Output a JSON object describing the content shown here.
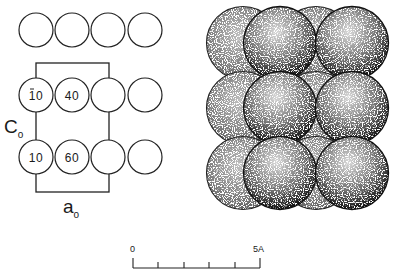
{
  "left_panel": {
    "rows": [
      {
        "name": "top-row",
        "cy": 30,
        "circles": [
          {
            "cx": 36,
            "label": ""
          },
          {
            "cx": 72,
            "label": ""
          },
          {
            "cx": 108,
            "label": ""
          },
          {
            "cx": 145,
            "label": ""
          }
        ]
      },
      {
        "name": "middle-row",
        "cy": 95,
        "circles": [
          {
            "cx": 36,
            "label": "10",
            "overbar": true
          },
          {
            "cx": 72,
            "label": "40"
          },
          {
            "cx": 108,
            "label": ""
          },
          {
            "cx": 145,
            "label": ""
          }
        ]
      },
      {
        "name": "bottom-row",
        "cy": 157,
        "circles": [
          {
            "cx": 36,
            "label": "10"
          },
          {
            "cx": 72,
            "label": "60"
          },
          {
            "cx": 108,
            "label": ""
          },
          {
            "cx": 145,
            "label": ""
          }
        ]
      }
    ],
    "radius": 17,
    "unit_cell": {
      "x1": 36,
      "y1": 63,
      "x2": 109,
      "y2": 192
    },
    "c_axis": {
      "main": "C",
      "sub": "o"
    },
    "a_axis": {
      "main": "a",
      "sub": "o"
    }
  },
  "right_panel": {
    "back_spheres": [
      {
        "cx": 243,
        "cy": 43
      },
      {
        "cx": 316,
        "cy": 43
      },
      {
        "cx": 243,
        "cy": 108
      },
      {
        "cx": 316,
        "cy": 108
      },
      {
        "cx": 243,
        "cy": 173
      },
      {
        "cx": 316,
        "cy": 173
      }
    ],
    "front_spheres": [
      {
        "cx": 280,
        "cy": 43
      },
      {
        "cx": 352,
        "cy": 43
      },
      {
        "cx": 280,
        "cy": 108
      },
      {
        "cx": 352,
        "cy": 108
      },
      {
        "cx": 280,
        "cy": 173
      },
      {
        "cx": 352,
        "cy": 173
      }
    ],
    "radius": 36.5
  },
  "scale_bar": {
    "start_label": "0",
    "end_label": "5A",
    "x1": 133,
    "x2": 260,
    "y": 268,
    "ticks": [
      133,
      158,
      184,
      209,
      235,
      260
    ]
  }
}
